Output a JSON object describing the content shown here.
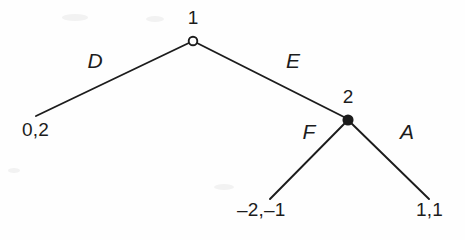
{
  "figure": {
    "type": "extensive-form-game-tree",
    "background_color": "#fefefe",
    "stroke_color": "#1c1c1c",
    "nodes": [
      {
        "id": "root",
        "label": "1",
        "marker": "open-circle",
        "x": 193,
        "y": 41,
        "label_x": 193,
        "label_y": 22
      },
      {
        "id": "player2",
        "label": "2",
        "marker": "filled-circle",
        "x": 348,
        "y": 120,
        "label_x": 348,
        "label_y": 101
      }
    ],
    "edges": [
      {
        "id": "edge-D",
        "label": "D",
        "from_x": 193,
        "from_y": 41,
        "to_x": 36,
        "to_y": 116,
        "label_x": 95,
        "label_y": 62
      },
      {
        "id": "edge-E",
        "label": "E",
        "from_x": 193,
        "from_y": 41,
        "to_x": 344,
        "to_y": 117,
        "label_x": 293,
        "label_y": 62
      },
      {
        "id": "edge-F",
        "label": "F",
        "from_x": 348,
        "from_y": 120,
        "to_x": 270,
        "to_y": 199,
        "label_x": 309,
        "label_y": 133
      },
      {
        "id": "edge-A",
        "label": "A",
        "from_x": 348,
        "from_y": 120,
        "to_x": 429,
        "to_y": 199,
        "label_x": 407,
        "label_y": 133
      }
    ],
    "terminals": [
      {
        "id": "terminal-D",
        "label": "0,2",
        "payoffs": [
          0,
          2
        ],
        "x": 22,
        "y": 134
      },
      {
        "id": "terminal-F",
        "label": "–2,–1",
        "payoffs": [
          -2,
          -1
        ],
        "x": 237,
        "y": 214
      },
      {
        "id": "terminal-A",
        "label": "1,1",
        "payoffs": [
          1,
          1
        ],
        "x": 416,
        "y": 214
      }
    ]
  }
}
